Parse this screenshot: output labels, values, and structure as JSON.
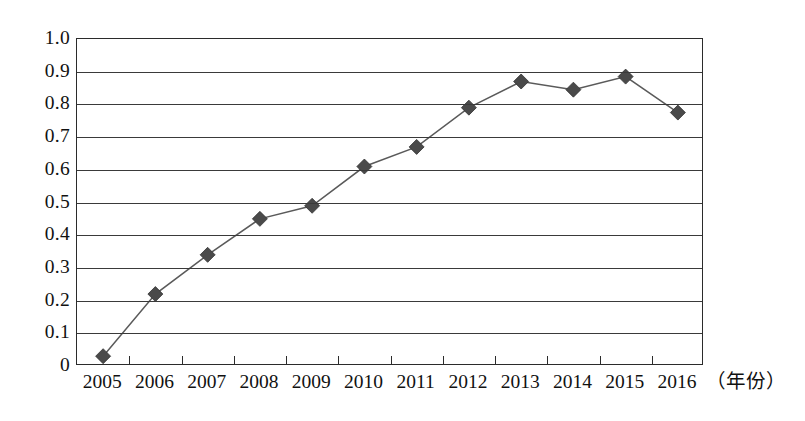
{
  "chart_data": {
    "type": "line",
    "title": "",
    "subtitle": "",
    "xlabel": "（年份）",
    "ylabel": "",
    "grid": true,
    "legend": "none",
    "xlim_categories": [
      "2005",
      "2006",
      "2007",
      "2008",
      "2009",
      "2010",
      "2011",
      "2012",
      "2013",
      "2014",
      "2015",
      "2016"
    ],
    "ylim": [
      0,
      1.0
    ],
    "ytick_step": 0.1,
    "categories": [
      "2005",
      "2006",
      "2007",
      "2008",
      "2009",
      "2010",
      "2011",
      "2012",
      "2013",
      "2014",
      "2015",
      "2016"
    ],
    "values": [
      0.03,
      0.22,
      0.34,
      0.45,
      0.49,
      0.61,
      0.67,
      0.79,
      0.87,
      0.845,
      0.885,
      0.775
    ],
    "series": [
      {
        "name": "series-1",
        "marker": "diamond",
        "color": "#4a4a4a",
        "values": [
          0.03,
          0.22,
          0.34,
          0.45,
          0.49,
          0.61,
          0.67,
          0.79,
          0.87,
          0.845,
          0.885,
          0.775
        ]
      }
    ],
    "ytick_labels": [
      "1.0",
      "0.9",
      "0.8",
      "0.7",
      "0.6",
      "0.5",
      "0.4",
      "0.3",
      "0.2",
      "0.1",
      "0"
    ],
    "ytick_values": [
      1.0,
      0.9,
      0.8,
      0.7,
      0.6,
      0.5,
      0.4,
      0.3,
      0.2,
      0.1,
      0.0
    ]
  },
  "axes": {
    "y_labels": [
      "1.0",
      "0.9",
      "0.8",
      "0.7",
      "0.6",
      "0.5",
      "0.4",
      "0.3",
      "0.2",
      "0.1",
      "0"
    ],
    "x_labels": [
      "2005",
      "2006",
      "2007",
      "2008",
      "2009",
      "2010",
      "2011",
      "2012",
      "2013",
      "2014",
      "2015",
      "2016"
    ],
    "x_axis_title": "（年份）"
  },
  "style": {
    "line_color": "#5a5a5a",
    "marker_color": "#4a4a4a",
    "axis_color": "#2b2b2b",
    "grid_color": "#3a3a3a",
    "text_color": "#111111",
    "background": "#ffffff"
  }
}
